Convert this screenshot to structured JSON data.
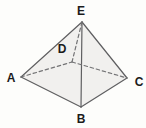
{
  "figure": {
    "colors": {
      "background": "#fdfdfb",
      "face_fill": "#f1f0ee",
      "edge_stroke": "#5f5f61",
      "hidden_edge_stroke": "#737375",
      "label_color": "#1b1b1b"
    },
    "vertices": [
      {
        "label": "A",
        "x": 21,
        "y": 77,
        "lx": 11,
        "ly": 78
      },
      {
        "label": "B",
        "x": 81,
        "y": 107,
        "lx": 81,
        "ly": 119
      },
      {
        "label": "C",
        "x": 127,
        "y": 78,
        "lx": 139,
        "ly": 82
      },
      {
        "label": "D",
        "x": 72,
        "y": 62,
        "lx": 62,
        "ly": 49
      },
      {
        "label": "E",
        "x": 82,
        "y": 22,
        "lx": 81,
        "ly": 11
      }
    ],
    "edges": [
      {
        "from": "A",
        "to": "E",
        "style": "solid"
      },
      {
        "from": "E",
        "to": "C",
        "style": "solid"
      },
      {
        "from": "A",
        "to": "B",
        "style": "solid"
      },
      {
        "from": "B",
        "to": "C",
        "style": "solid"
      },
      {
        "from": "E",
        "to": "B",
        "style": "solid"
      },
      {
        "from": "E",
        "to": "D",
        "style": "dashed"
      },
      {
        "from": "A",
        "to": "D",
        "style": "dashed"
      },
      {
        "from": "D",
        "to": "C",
        "style": "dashed"
      }
    ],
    "silhouette": [
      "A",
      "E",
      "C",
      "B"
    ]
  }
}
